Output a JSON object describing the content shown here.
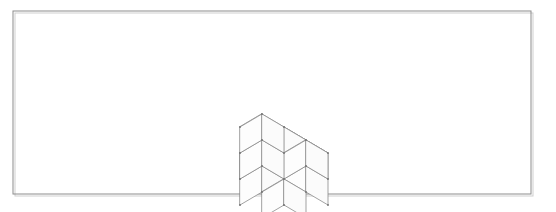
{
  "figure": {
    "kind": "isometric-cube-stack",
    "caption": "",
    "canvas": {
      "width": 556,
      "height": 212,
      "background": "#ffffff"
    },
    "frame": {
      "x": 13,
      "y": 11,
      "width": 518,
      "height": 183,
      "stroke": "#8c8c8c",
      "stroke_width": 1,
      "shadow_offset": 2,
      "shadow_stroke": "#cfcfcf"
    },
    "projection": {
      "origin_x": 284,
      "origin_y": 153,
      "half_width": 22,
      "half_depth": 13,
      "cube_height": 26,
      "stroke": "#8a8a8a",
      "stroke_width": 0.8,
      "face_fill": "#ffffff",
      "vertex_dot_radius": 0.9,
      "vertex_dot_color": "#6f6f6f"
    },
    "cubes": [
      {
        "x": 0,
        "y": 0,
        "z": 0,
        "name": "base-front"
      },
      {
        "x": 1,
        "y": 0,
        "z": 0,
        "name": "base-front-right"
      },
      {
        "x": 0,
        "y": 1,
        "z": 0,
        "name": "base-left"
      },
      {
        "x": 1,
        "y": 1,
        "z": 0,
        "name": "base-center"
      },
      {
        "x": 2,
        "y": 1,
        "z": 0,
        "name": "base-right"
      },
      {
        "x": 1,
        "y": 2,
        "z": 0,
        "name": "base-back-left"
      },
      {
        "x": 2,
        "y": 2,
        "z": 0,
        "name": "base-back-right"
      },
      {
        "x": 1,
        "y": 1,
        "z": 1,
        "name": "mid-center"
      },
      {
        "x": 2,
        "y": 1,
        "z": 1,
        "name": "mid-right"
      },
      {
        "x": 1,
        "y": 2,
        "z": 1,
        "name": "mid-back-left"
      },
      {
        "x": 1,
        "y": 2,
        "z": 2,
        "name": "top-cube"
      }
    ],
    "cube_count": 11
  }
}
